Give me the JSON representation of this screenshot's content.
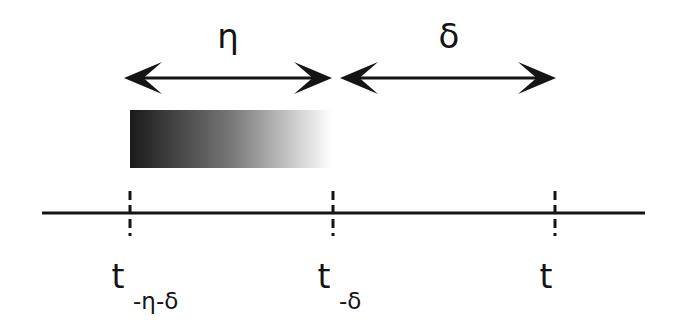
{
  "figure": {
    "background_color": "#ffffff",
    "ink_color": "#141414"
  },
  "intervals": [
    {
      "id": "eta",
      "symbol": "η",
      "symbol_x": 228,
      "symbol_y": 48,
      "arrow_y": 78,
      "arrow_x1": 124,
      "arrow_x2": 332
    },
    {
      "id": "delta",
      "symbol": "δ",
      "symbol_x": 449,
      "symbol_y": 48,
      "arrow_y": 78,
      "arrow_x1": 340,
      "arrow_x2": 556
    }
  ],
  "gradient_bar": {
    "name": "memory-decay-bar",
    "x": 130,
    "y": 110,
    "width": 202,
    "height": 58,
    "color_start": "#1a1a1a",
    "color_mid": "#777777",
    "color_end": "#ffffff"
  },
  "axis": {
    "name": "time-axis",
    "x1": 42,
    "x2": 645,
    "y": 213,
    "stroke_width": 3
  },
  "ticks": [
    {
      "id": "t-minus-eta-minus-delta",
      "x": 130,
      "y_top": 191,
      "y_bottom": 236,
      "label_main": "t",
      "label_sub": "-η-δ",
      "label_main_x": 118,
      "label_main_y": 288,
      "label_sub_x": 133,
      "label_sub_y": 309
    },
    {
      "id": "t-minus-delta",
      "x": 333,
      "y_top": 191,
      "y_bottom": 236,
      "label_main": "t",
      "label_sub": "-δ",
      "label_main_x": 324,
      "label_main_y": 288,
      "label_sub_x": 339,
      "label_sub_y": 309
    },
    {
      "id": "t",
      "x": 555,
      "y_top": 191,
      "y_bottom": 236,
      "label_main": "t",
      "label_sub": "",
      "label_main_x": 546,
      "label_main_y": 288,
      "label_sub_x": 561,
      "label_sub_y": 309
    }
  ]
}
